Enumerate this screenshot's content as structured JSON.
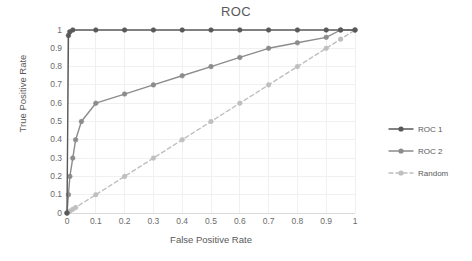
{
  "chart_data": {
    "type": "line",
    "title": "ROC",
    "xlabel": "False Positive Rate",
    "ylabel": "True Positive Rate",
    "xlim": [
      0,
      1
    ],
    "ylim": [
      0,
      1
    ],
    "xticks": [
      "0",
      "0.1",
      "0.2",
      "0.3",
      "0.4",
      "0.5",
      "0.6",
      "0.7",
      "0.8",
      "0.9",
      "1"
    ],
    "yticks": [
      "0",
      "0.1",
      "0.2",
      "0.3",
      "0.4",
      "0.5",
      "0.6",
      "0.7",
      "0.8",
      "0.9",
      "1"
    ],
    "grid": true,
    "legend_position": "right",
    "series": [
      {
        "name": "ROC 1",
        "color": "#595959",
        "style": "solid",
        "marker": "circle",
        "x": [
          0,
          0.005,
          0.01,
          0.02,
          0.1,
          0.2,
          0.3,
          0.4,
          0.5,
          0.6,
          0.7,
          0.8,
          0.9,
          0.95,
          1
        ],
        "y": [
          0,
          0.97,
          0.99,
          1,
          1,
          1,
          1,
          1,
          1,
          1,
          1,
          1,
          1,
          1,
          1
        ]
      },
      {
        "name": "ROC 2",
        "color": "#8c8c8c",
        "style": "solid",
        "marker": "circle",
        "x": [
          0,
          0.005,
          0.01,
          0.02,
          0.03,
          0.05,
          0.1,
          0.2,
          0.3,
          0.4,
          0.5,
          0.6,
          0.7,
          0.8,
          0.9,
          0.95,
          1
        ],
        "y": [
          0,
          0.1,
          0.2,
          0.3,
          0.4,
          0.5,
          0.6,
          0.65,
          0.7,
          0.75,
          0.8,
          0.85,
          0.9,
          0.93,
          0.96,
          1,
          1
        ]
      },
      {
        "name": "Random",
        "color": "#bfbfbf",
        "style": "dashed",
        "marker": "circle",
        "x": [
          0,
          0.01,
          0.02,
          0.03,
          0.1,
          0.2,
          0.3,
          0.4,
          0.5,
          0.6,
          0.7,
          0.8,
          0.9,
          0.95,
          1
        ],
        "y": [
          0,
          0.01,
          0.02,
          0.03,
          0.1,
          0.2,
          0.3,
          0.4,
          0.5,
          0.6,
          0.7,
          0.8,
          0.9,
          0.95,
          1
        ]
      }
    ]
  },
  "legend": {
    "items": [
      {
        "label": "ROC 1"
      },
      {
        "label": "ROC 2"
      },
      {
        "label": "Random"
      }
    ]
  },
  "colors": {
    "roc1": "#595959",
    "roc2": "#8c8c8c",
    "random": "#bfbfbf",
    "grid": "#f0f0f0",
    "axis": "#d9d9d9",
    "text": "#595959"
  }
}
